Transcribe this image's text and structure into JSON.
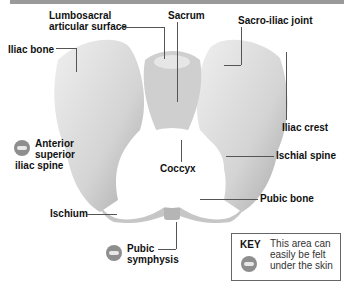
{
  "figure": {
    "labels": {
      "lumbosacral": "Lumbosacral\narticular surface",
      "lumbosacral_l1": "Lumbosacral",
      "lumbosacral_l2": "articular surface",
      "sacrum": "Sacrum",
      "sacro_iliac_joint": "Sacro-iliac joint",
      "iliac_bone": "Iliac bone",
      "asis_l1": "Anterior",
      "asis_l2": "superior",
      "asis_l3": "iliac spine",
      "iliac_crest": "Iliac crest",
      "coccyx": "Coccyx",
      "ischial_spine": "Ischial spine",
      "pubic_bone": "Pubic bone",
      "ischium": "Ischium",
      "pubic_l1": "Pubic",
      "pubic_l2": "symphysis"
    },
    "key": {
      "title": "KEY",
      "icon": "palpation-hand-icon",
      "text": "This area can easily be felt under the skin"
    },
    "colors": {
      "bone": "#d9d9d9",
      "bone_shadow": "#a8a8a8",
      "text": "#111111",
      "leader_line": "#555555"
    }
  }
}
